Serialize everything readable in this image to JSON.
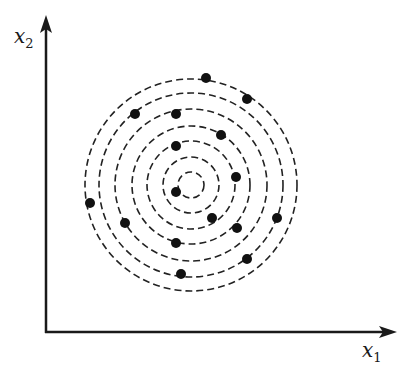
{
  "diagram": {
    "axes": {
      "x": {
        "label_base": "x",
        "label_sub": "1"
      },
      "y": {
        "label_base": "x",
        "label_sub": "2"
      },
      "origin": [
        46,
        332
      ],
      "x_end": [
        397,
        332
      ],
      "y_end": [
        46,
        15
      ]
    },
    "circles": {
      "center": [
        191,
        185
      ],
      "radii": [
        13,
        28,
        44,
        59,
        76,
        92,
        106
      ],
      "style": "dashed",
      "color": "#222222"
    },
    "points": [
      [
        206,
        78
      ],
      [
        247,
        99
      ],
      [
        135,
        114
      ],
      [
        176,
        114
      ],
      [
        221,
        135
      ],
      [
        176,
        146
      ],
      [
        236,
        177
      ],
      [
        176,
        192
      ],
      [
        90,
        203
      ],
      [
        212,
        218
      ],
      [
        277,
        218
      ],
      [
        125,
        223
      ],
      [
        237,
        228
      ],
      [
        176,
        243
      ],
      [
        247,
        259
      ],
      [
        181,
        274
      ]
    ],
    "point_radius": 5,
    "point_color": "#111111",
    "axis_color": "#1a1a1a"
  }
}
